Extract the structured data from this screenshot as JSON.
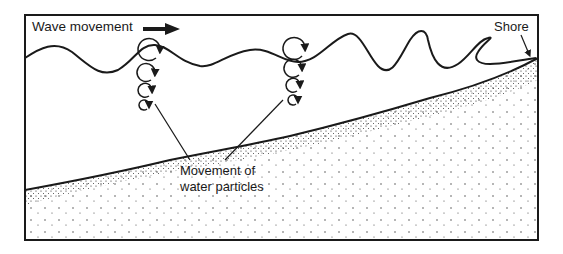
{
  "diagram": {
    "labels": {
      "wave_movement": "Wave movement",
      "shore": "Shore",
      "particles_line1": "Movement  of",
      "particles_line2": "water particles"
    },
    "icons": {
      "direction_arrow": "bold-right-arrow",
      "orbit": "circular-orbit-arrow"
    },
    "colors": {
      "ink": "#1a1a1a",
      "background": "#ffffff"
    }
  }
}
